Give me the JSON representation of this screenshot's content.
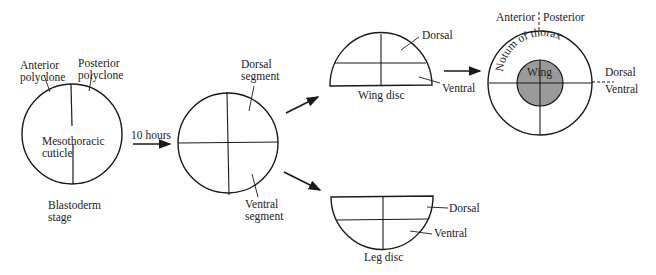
{
  "diagram": {
    "stage1": {
      "anterior_label": "Anterior",
      "anterior_label2": "polyclone",
      "posterior_label": "Posterior",
      "posterior_label2": "polyclone",
      "center_label1": "Mesothoracic",
      "center_label2": "cuticle",
      "bottom_label1": "Blastoderm",
      "bottom_label2": "stage"
    },
    "arrow1": {
      "label": "10 hours"
    },
    "stage2": {
      "dorsal_label1": "Dorsal",
      "dorsal_label2": "segment",
      "ventral_label1": "Ventral",
      "ventral_label2": "segment"
    },
    "wing_disc": {
      "title": "Wing disc",
      "dorsal_label": "Dorsal",
      "ventral_label": "Ventral"
    },
    "leg_disc": {
      "title": "Leg disc",
      "dorsal_label": "Dorsal",
      "ventral_label": "Ventral"
    },
    "adult": {
      "anterior_label": "Anterior",
      "posterior_label": "Posterior",
      "notum_label": "Notum of thorax",
      "wing_label": "Wing",
      "dorsal_label": "Dorsal",
      "ventral_label": "Ventral",
      "wing_fill": "#9a9a9a"
    }
  }
}
